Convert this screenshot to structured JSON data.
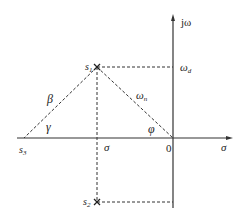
{
  "diagram": {
    "type": "s-plane pole diagram",
    "axes": {
      "vertical_label": "jω",
      "horizontal_label": "σ",
      "origin_label": "0"
    },
    "points": {
      "s1": {
        "label": "s",
        "sub": "1"
      },
      "s2": {
        "label": "s",
        "sub": "2"
      },
      "s3": {
        "label": "s",
        "sub": "3"
      }
    },
    "labels": {
      "omega_d": {
        "main": "ω",
        "sub": "d"
      },
      "omega_n": {
        "main": "ω",
        "sub": "n"
      },
      "sigma_point": "σ",
      "beta": "β",
      "gamma": "γ",
      "phi": "φ"
    },
    "colors": {
      "line": "#333333",
      "background": "#ffffff"
    }
  }
}
